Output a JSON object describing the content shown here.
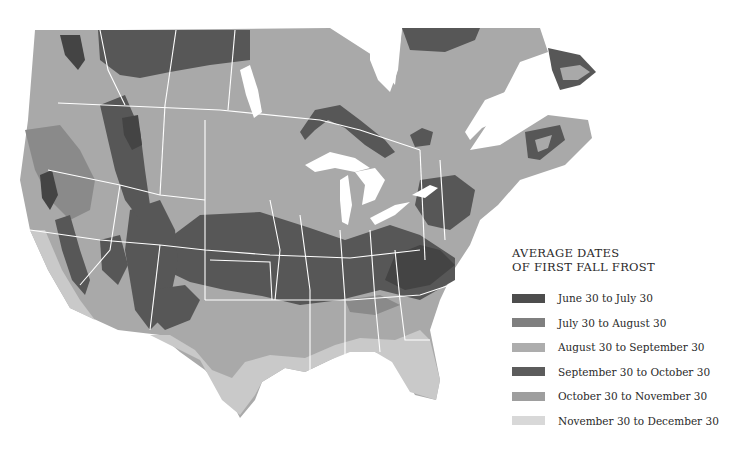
{
  "legend": {
    "title_line1": "AVERAGE DATES",
    "title_line2": "OF FIRST FALL FROST",
    "items": [
      {
        "label": "June 30 to July 30",
        "color": "#4d4d4d"
      },
      {
        "label": "July 30 to August 30",
        "color": "#7f7f7f"
      },
      {
        "label": "August 30 to September 30",
        "color": "#adadad"
      },
      {
        "label": "September 30 to October 30",
        "color": "#5c5c5c"
      },
      {
        "label": "October 30 to November 30",
        "color": "#9e9e9e"
      },
      {
        "label": "November 30 to December 30",
        "color": "#d8d8d8"
      }
    ]
  },
  "map": {
    "region": "North America (United States and southern Canada)",
    "colors": {
      "land_base": "#a9a9a9",
      "dark": "#575757",
      "darkest": "#444444",
      "mid": "#8a8a8a",
      "light": "#c9c9c9",
      "water": "#ffffff",
      "borders": "#ffffff"
    }
  }
}
